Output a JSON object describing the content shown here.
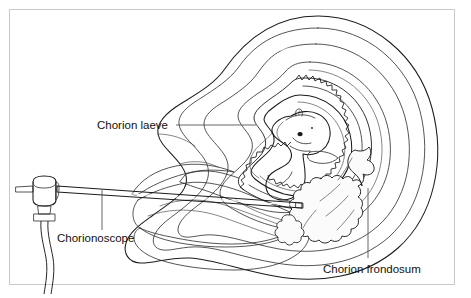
{
  "figure": {
    "kind": "medical-illustration",
    "border_color": "#c9c9c9",
    "background_color": "#ffffff",
    "ink_color": "#1b1b1b"
  },
  "labels": {
    "chorion_laeve": "Chorion laeve",
    "chorionoscope": "Chorionoscope",
    "chorion_frondosum": "Chorion frondosum"
  },
  "palette": {
    "myometrium_outer": "#d4d4d4",
    "myometrium_mid": "#cccccc",
    "decidua": "#bdbdbd",
    "cut_surface_dark": "#9a9a9a",
    "cut_surface_mid": "#b0b0b0",
    "cavity_light": "#ededed",
    "cavity_lighter": "#f4f4f4",
    "amnion_fill": "#e4e4e4",
    "embryo_fill": "#f2f2f2",
    "villi_fill": "#fafafa",
    "instrument_fill": "#f7f7f7",
    "highlight_white": "#ffffff"
  },
  "parts": {
    "uterus": "uterus-outline",
    "chorion_laeve": "serrated-chorion-ring",
    "chorion_frondosum": "branching-villi",
    "embryo": "curled-embryo",
    "amniotic_cavity": "amniotic-cavity",
    "cervical_canal": "cervical-canal",
    "scope_body": "scope-eyepiece-body",
    "scope_shaft": "scope-shaft",
    "scope_collar": "scope-collar",
    "scope_cable": "scope-light-cable"
  }
}
